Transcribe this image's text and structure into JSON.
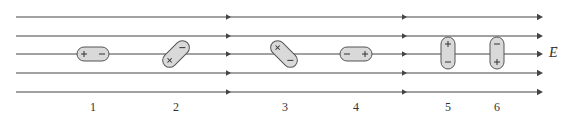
{
  "diagram": {
    "title": "",
    "field_label": "E",
    "field_label_vector_arrow": "→",
    "colors": {
      "line": "#444444",
      "dipole_fill": "#d9d9d9",
      "dipole_stroke": "#555555",
      "text": "#333333"
    },
    "field_lines": {
      "count": 5,
      "x_start": 16,
      "x_end": 543,
      "y_positions": [
        17,
        36,
        54,
        73,
        92
      ],
      "mid_arrow_x": [
        228,
        404
      ]
    },
    "dipoles": [
      {
        "id": "1",
        "label": "1",
        "cx": 93,
        "cy": 54,
        "angle_deg": 0,
        "orientation": "horizontal",
        "plus_side": "left",
        "minus_side": "right",
        "plus": "+",
        "minus": "−"
      },
      {
        "id": "2",
        "label": "2",
        "cx": 176,
        "cy": 54,
        "angle_deg": -45,
        "orientation": "diagonal",
        "plus_side": "upper-right",
        "minus_side": "lower-left",
        "plus": "+",
        "minus": "−"
      },
      {
        "id": "3",
        "label": "3",
        "cx": 284,
        "cy": 54,
        "angle_deg": 45,
        "orientation": "diagonal",
        "plus_side": "upper-left",
        "minus_side": "lower-right",
        "plus": "+",
        "minus": "−"
      },
      {
        "id": "4",
        "label": "4",
        "cx": 356,
        "cy": 54,
        "angle_deg": 180,
        "orientation": "horizontal",
        "plus_side": "right",
        "minus_side": "left",
        "plus": "+",
        "minus": "−"
      },
      {
        "id": "5",
        "label": "5",
        "cx": 448,
        "cy": 53,
        "angle_deg": 90,
        "orientation": "vertical",
        "plus_side": "top",
        "minus_side": "bottom",
        "plus": "+",
        "minus": "−"
      },
      {
        "id": "6",
        "label": "6",
        "cx": 497,
        "cy": 53,
        "angle_deg": -90,
        "orientation": "vertical",
        "plus_side": "bottom",
        "minus_side": "top",
        "plus": "+",
        "minus": "−"
      }
    ],
    "labels": [
      {
        "text": "1",
        "x": 93,
        "y": 107
      },
      {
        "text": "2",
        "x": 176,
        "y": 107
      },
      {
        "text": "3",
        "x": 285,
        "y": 107
      },
      {
        "text": "4",
        "x": 356,
        "y": 107
      },
      {
        "text": "5",
        "x": 448,
        "y": 107
      },
      {
        "text": "6",
        "x": 497,
        "y": 107
      }
    ]
  }
}
